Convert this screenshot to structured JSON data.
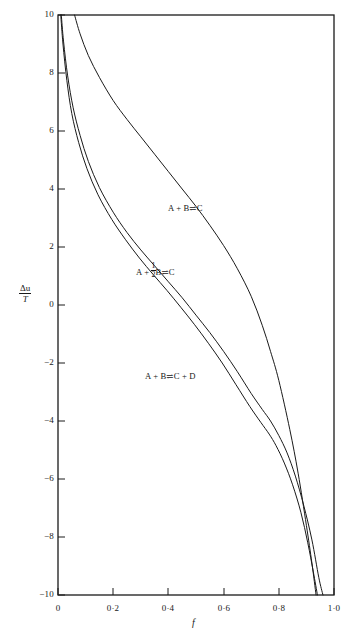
{
  "figure": {
    "background_color": "#ffffff",
    "line_color": "#1a1a1a",
    "axis_color": "#1a1a1a"
  },
  "axes": {
    "x_axis_label": "f",
    "y_axis_label_numerator": "Δu",
    "y_axis_label_denominator": "T",
    "x_ticks": [
      "0",
      "0·2",
      "0·4",
      "0·6",
      "0·8",
      "1·0"
    ],
    "x_tick_values": [
      0,
      0.2,
      0.4,
      0.6,
      0.8,
      1.0
    ],
    "y_ticks": [
      "10",
      "8",
      "6",
      "4",
      "2",
      "0",
      "−2",
      "−4",
      "−6",
      "−8",
      "−10"
    ],
    "y_tick_values": [
      10,
      8,
      6,
      4,
      2,
      0,
      -2,
      -4,
      -6,
      -8,
      -10
    ]
  },
  "curve_labels": {
    "upper": {
      "prefix": "A + B",
      "arrow": "⇌",
      "suffix": "C"
    },
    "middle": {
      "prefix": "A + ",
      "half_num": "1",
      "half_den": "2",
      "mid": "B",
      "arrow": "⇌",
      "suffix": "C"
    },
    "lower": {
      "prefix": "A + B",
      "arrow": "⇌",
      "suffix": "C + D"
    }
  },
  "chart_data": {
    "type": "line",
    "title": "",
    "subtitle": "",
    "xlabel": "f",
    "ylabel": "Δu/T",
    "xlim": [
      0.0,
      1.0
    ],
    "ylim": [
      -10,
      10
    ],
    "grid": false,
    "legend_position": "inline-annotations",
    "x_ticks": [
      0,
      0.2,
      0.4,
      0.6,
      0.8,
      1.0
    ],
    "y_ticks": [
      10,
      8,
      6,
      4,
      2,
      0,
      -2,
      -4,
      -6,
      -8,
      -10
    ],
    "annotations": [
      {
        "text": "A + B ⇌ C",
        "x": 0.46,
        "y": 3.1
      },
      {
        "text": "A + ½B ⇌ C",
        "x": 0.33,
        "y": 1.2
      },
      {
        "text": "A + B ⇌ C + D",
        "x": 0.31,
        "y": -2.55
      }
    ],
    "series": [
      {
        "name": "A + B ⇌ C",
        "label_text": "A + B ⇌ C",
        "x": [
          0.06,
          0.08,
          0.11,
          0.15,
          0.2,
          0.25,
          0.3,
          0.35,
          0.4,
          0.45,
          0.5,
          0.55,
          0.6,
          0.65,
          0.7,
          0.74,
          0.77,
          0.8,
          0.84,
          0.87,
          0.9,
          0.92,
          0.935
        ],
        "y": [
          10.0,
          9.35,
          8.6,
          7.85,
          7.05,
          6.4,
          5.8,
          5.2,
          4.6,
          4.0,
          3.4,
          2.75,
          2.05,
          1.25,
          0.3,
          -0.7,
          -1.6,
          -2.6,
          -4.3,
          -5.8,
          -7.6,
          -8.9,
          -10.0
        ]
      },
      {
        "name": "A + ½B ⇌ C",
        "label_text": "A + ½B ⇌ C",
        "x": [
          0.012,
          0.02,
          0.035,
          0.055,
          0.08,
          0.11,
          0.15,
          0.2,
          0.25,
          0.3,
          0.35,
          0.4,
          0.45,
          0.5,
          0.55,
          0.6,
          0.65,
          0.7,
          0.74,
          0.77,
          0.8,
          0.83,
          0.86,
          0.89,
          0.92,
          0.945,
          0.96
        ],
        "y": [
          10.0,
          9.1,
          7.9,
          6.8,
          5.85,
          4.95,
          4.05,
          3.2,
          2.5,
          1.9,
          1.35,
          0.8,
          0.25,
          -0.35,
          -0.95,
          -1.6,
          -2.3,
          -3.05,
          -3.6,
          -4.0,
          -4.5,
          -5.1,
          -5.9,
          -6.9,
          -8.1,
          -9.4,
          -10.0
        ]
      },
      {
        "name": "A + B ⇌ C + D",
        "label_text": "A + B ⇌ C + D",
        "x": [
          0.01,
          0.018,
          0.032,
          0.05,
          0.075,
          0.105,
          0.145,
          0.195,
          0.245,
          0.295,
          0.345,
          0.395,
          0.445,
          0.495,
          0.545,
          0.595,
          0.645,
          0.695,
          0.735,
          0.765,
          0.79,
          0.82,
          0.85,
          0.88,
          0.905,
          0.925,
          0.94
        ],
        "y": [
          10.0,
          9.0,
          7.75,
          6.6,
          5.6,
          4.7,
          3.8,
          2.95,
          2.25,
          1.62,
          1.05,
          0.5,
          -0.08,
          -0.68,
          -1.32,
          -2.0,
          -2.75,
          -3.5,
          -4.05,
          -4.45,
          -4.85,
          -5.45,
          -6.2,
          -7.15,
          -8.2,
          -9.2,
          -10.0
        ]
      }
    ]
  }
}
